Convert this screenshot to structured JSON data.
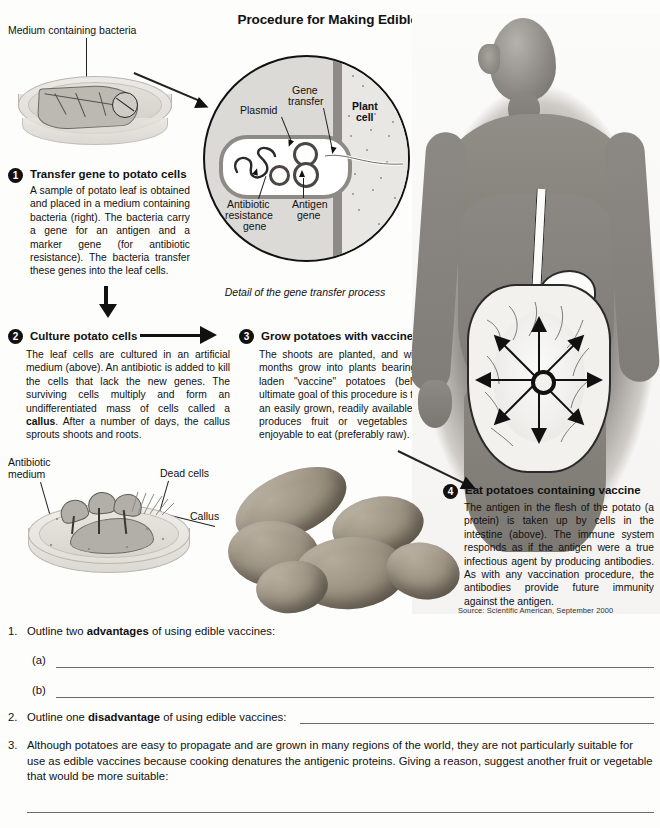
{
  "title": "Procedure for Making Edible Vaccines",
  "diagram": {
    "top_dish_label": "Medium containing bacteria",
    "detail_caption": "Detail of the gene transfer process",
    "detail_labels": {
      "plasmid": "Plasmid",
      "gene_transfer": "Gene\ntransfer",
      "gene_transfer_line1": "Gene",
      "gene_transfer_line2": "transfer",
      "plant_cell_line1": "Plant",
      "plant_cell_line2": "cell",
      "antibiotic_resistance_line1": "Antibiotic",
      "antibiotic_resistance_line2": "resistance",
      "antibiotic_resistance_line3": "gene",
      "antigen_line1": "Antigen",
      "antigen_line2": "gene"
    },
    "lower_dish_labels": {
      "antibiotic_medium_line1": "Antibiotic",
      "antibiotic_medium_line2": "medium",
      "dead_cells": "Dead cells",
      "callus": "Callus"
    }
  },
  "steps": [
    {
      "number": "1",
      "heading": "Transfer gene to potato cells",
      "body": "A sample of potato leaf is obtained and placed in a medium containing bacteria (right). The bacteria carry a gene for an antigen and a marker gene (for antibiotic resistance). The bacteria transfer these genes into the leaf cells."
    },
    {
      "number": "2",
      "heading": "Culture potato cells",
      "body_pre": "The leaf cells are cultured in an artificial medium (above). An antibiotic is added to kill the cells that lack the new genes. The surviving cells multiply and form an undifferentiated mass of cells called a ",
      "body_bold": "callus",
      "body_post": ". After a number of days, the callus sprouts shoots and roots."
    },
    {
      "number": "3",
      "heading": "Grow potatoes with vaccine",
      "body": "The shoots are planted, and within three months grow into plants bearing antigen-laden \"vaccine\" potatoes (below). The ultimate goal of this procedure is to produce an easily grown, readily available plant that produces fruit or vegetables that are enjoyable to eat (preferably raw)."
    },
    {
      "number": "4",
      "heading": "Eat potatoes containing vaccine",
      "body": "The antigen in the flesh of the potato (a protein) is taken up by cells in the intestine (above). The immune system responds as if the antigen were a true infectious agent by producing antibodies. As with any vaccination procedure, the antibodies provide future immunity against the antigen."
    }
  ],
  "source": "Source: Scientific American, September 2000",
  "questions": [
    {
      "number": "1.",
      "text_pre": "Outline two ",
      "text_bold": "advantages",
      "text_post": " of using edible vaccines:",
      "subparts": [
        "(a)",
        "(b)"
      ]
    },
    {
      "number": "2.",
      "text_pre": "Outline one ",
      "text_bold": "disadvantage",
      "text_post": " of using edible vaccines:"
    },
    {
      "number": "3.",
      "text": "Although potatoes are easy to propagate and are grown in many regions of the world, they are not particularly suitable for use as edible vaccines because cooking denatures the antigenic proteins. Giving a reason, suggest another fruit or vegetable that would be more suitable:"
    }
  ],
  "colors": {
    "ink": "#111111",
    "rule": "#6a6a6a",
    "page_bg": "#fdfdfc",
    "diagram_gray": "#dcdad6",
    "wall_gray": "#8e8b86"
  }
}
